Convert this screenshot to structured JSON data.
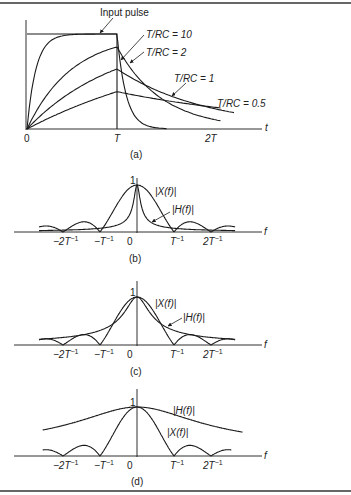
{
  "figure": {
    "panels": [
      "(a)",
      "(b)",
      "(c)",
      "(d)"
    ]
  },
  "chart_data": [
    {
      "type": "line",
      "panel": "(a)",
      "title": "RC lowpass filter response to rectangular pulse",
      "xlabel": "t",
      "x_ticks": [
        "0",
        "T",
        "2T"
      ],
      "annotations": {
        "input": "Input pulse",
        "series_labels": [
          "T/RC = 10",
          "T/RC = 2",
          "T/RC = 1",
          "T/RC = 0.5"
        ]
      },
      "series": [
        {
          "name": "Input pulse",
          "shape": "rect",
          "amplitude": 1,
          "width_T": 1
        },
        {
          "name": "T/RC = 10",
          "k": 10,
          "peak_at_T": 1.0
        },
        {
          "name": "T/RC = 2",
          "k": 2,
          "peak_at_T": 0.865
        },
        {
          "name": "T/RC = 1",
          "k": 1,
          "peak_at_T": 0.632
        },
        {
          "name": "T/RC = 0.5",
          "k": 0.5,
          "peak_at_T": 0.393
        }
      ],
      "xlim": [
        0,
        2.3
      ],
      "ylim": [
        0,
        1
      ]
    },
    {
      "type": "line",
      "panel": "(b)",
      "xlabel": "f",
      "x_ticks": [
        "−2T⁻¹",
        "−T⁻¹",
        "0",
        "T⁻¹",
        "2T⁻¹"
      ],
      "y_tick": "1",
      "series": [
        {
          "name": "|X(f)|",
          "formula": "|sinc(fT)|"
        },
        {
          "name": "|H(f)|",
          "formula": "1/sqrt(1+(2πfRC)^2)",
          "T_over_RC": 0.5
        }
      ],
      "xlim": [
        -2.5,
        2.5
      ],
      "ylim": [
        0,
        1
      ]
    },
    {
      "type": "line",
      "panel": "(c)",
      "xlabel": "f",
      "x_ticks": [
        "−2T⁻¹",
        "−T⁻¹",
        "0",
        "T⁻¹",
        "2T⁻¹"
      ],
      "y_tick": "1",
      "series": [
        {
          "name": "|X(f)|",
          "formula": "|sinc(fT)|"
        },
        {
          "name": "|H(f)|",
          "formula": "1/sqrt(1+(2πfRC)^2)",
          "T_over_RC": 2
        }
      ],
      "xlim": [
        -2.5,
        2.5
      ],
      "ylim": [
        0,
        1
      ]
    },
    {
      "type": "line",
      "panel": "(d)",
      "xlabel": "f",
      "x_ticks": [
        "−2T⁻¹",
        "−T⁻¹",
        "0",
        "T⁻¹",
        "2T⁻¹"
      ],
      "y_tick": "1",
      "series": [
        {
          "name": "|H(f)|",
          "formula": "1/sqrt(1+(2πfRC)^2)",
          "T_over_RC": 10
        },
        {
          "name": "|X(f)|",
          "formula": "|sinc(fT)|"
        }
      ],
      "xlim": [
        -2.5,
        2.5
      ],
      "ylim": [
        0,
        1
      ]
    }
  ],
  "labels": {
    "a": {
      "input": "Input pulse",
      "rc10": "T/RC = 10",
      "rc2": "T/RC = 2",
      "rc1": "T/RC = 1",
      "rc05": "T/RC = 0.5",
      "t0": "0",
      "tT": "T",
      "t2T": "2T",
      "axis": "t",
      "caption": "(a)"
    },
    "b": {
      "one": "1",
      "X": "|X(f)|",
      "H": "|H(f)|",
      "caption": "(b)"
    },
    "c": {
      "one": "1",
      "X": "|X(f)|",
      "H": "|H(f)|",
      "caption": "(c)"
    },
    "d": {
      "one": "1",
      "X": "|X(f)|",
      "H": "|H(f)|",
      "caption": "(d)"
    },
    "freq": {
      "m2": "−2T",
      "m1": "−T",
      "zero": "0",
      "p1": "T",
      "p2": "2T",
      "exp": "−1",
      "axis": "f"
    }
  }
}
